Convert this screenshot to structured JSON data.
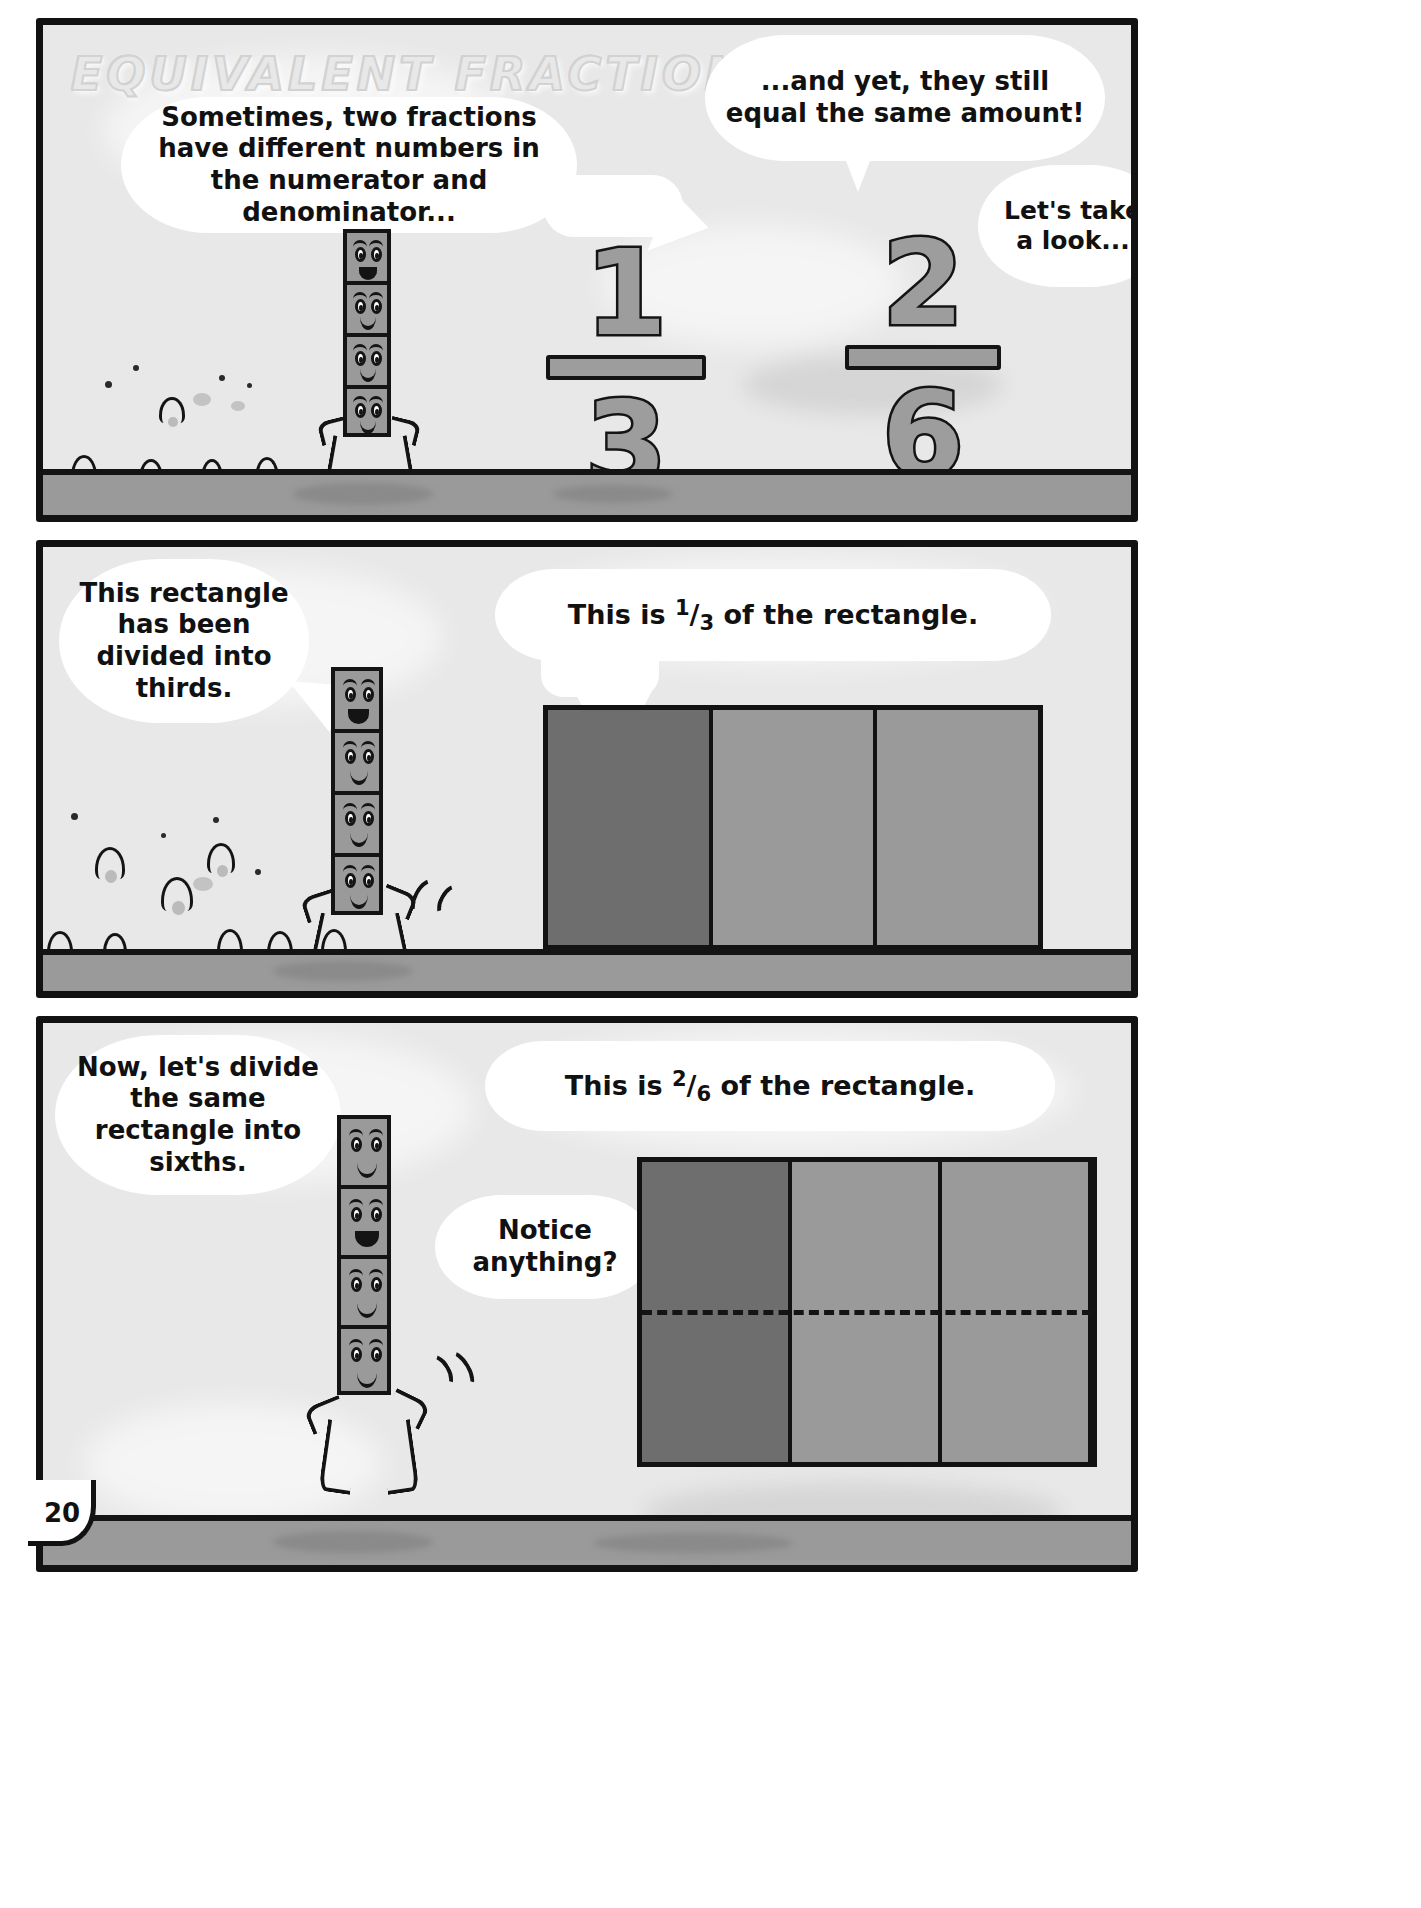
{
  "page": {
    "number": "20",
    "title": "EQUIVALENT FRACTIONS",
    "colors": {
      "ink": "#121212",
      "panel_background": "#e8e8e8",
      "bubble": "#ffffff",
      "block_gray": "#9a9a9a",
      "shaded_gray": "#6e6e6e",
      "ground_gray": "#9a9a9a",
      "title_gray": "#d2d2d2"
    }
  },
  "panels": [
    {
      "id": "panel-1",
      "bubbles": [
        {
          "name": "intro-bubble",
          "text": "Sometimes, two fractions have different numbers in the numerator and denominator..."
        },
        {
          "name": "and-yet-bubble",
          "text": "...and yet, they still equal the same amount!"
        },
        {
          "name": "lets-take-a-look-bubble",
          "text": "Let's take a look..."
        }
      ],
      "fractions": [
        {
          "name": "fraction-one-third",
          "numerator": "1",
          "denominator": "3"
        },
        {
          "name": "fraction-two-sixths",
          "numerator": "2",
          "denominator": "6"
        }
      ]
    },
    {
      "id": "panel-2",
      "bubbles": [
        {
          "name": "thirds-bubble",
          "text": "This rectangle has been divided into thirds."
        },
        {
          "name": "one-third-label-bubble",
          "prefix": "This is ",
          "numerator": "1",
          "slash": "/",
          "denominator": "3",
          "suffix": " of the rectangle."
        }
      ],
      "diagram": {
        "name": "thirds-rectangle",
        "parts": 3,
        "shaded": 1,
        "rows": 1,
        "dashed_midline": false
      }
    },
    {
      "id": "panel-3",
      "bubbles": [
        {
          "name": "sixths-bubble",
          "text": "Now, let's divide the same rectangle into sixths."
        },
        {
          "name": "notice-anything-bubble",
          "text": "Notice anything?"
        },
        {
          "name": "two-sixths-label-bubble",
          "prefix": "This is ",
          "numerator": "2",
          "slash": "/",
          "denominator": "6",
          "suffix": " of the rectangle."
        }
      ],
      "diagram": {
        "name": "sixths-rectangle",
        "parts": 3,
        "shaded": 1,
        "rows": 2,
        "dashed_midline": true
      }
    }
  ]
}
